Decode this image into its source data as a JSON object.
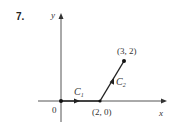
{
  "problem_number": "7.",
  "axes": {
    "x_label": "x",
    "y_label": "y",
    "origin_label": "0"
  },
  "points": [
    {
      "label": "(2, 0)",
      "x": 2,
      "y": 0
    },
    {
      "label": "(3, 2)",
      "x": 3,
      "y": 2
    }
  ],
  "curves": [
    {
      "name": "C",
      "subscript": "1",
      "from": [
        0,
        0
      ],
      "to": [
        2,
        0
      ]
    },
    {
      "name": "C",
      "subscript": "2",
      "from": [
        2,
        0
      ],
      "to": [
        3,
        2
      ]
    }
  ],
  "colors": {
    "line": "#222222",
    "text": "#333333"
  }
}
